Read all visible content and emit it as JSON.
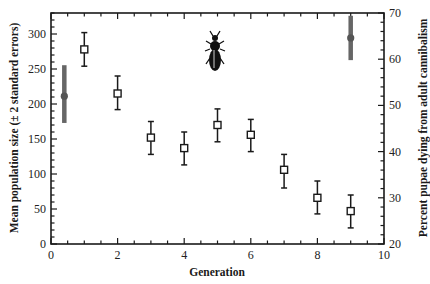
{
  "chart_data": {
    "type": "scatter",
    "title": "",
    "xlabel": "Generation",
    "ylabel": "Mean population size (± 2 standard errors)",
    "ylabel_right": "Percent pupae dying from adult cannibalism",
    "xlim": [
      0,
      10
    ],
    "ylim": [
      0,
      330
    ],
    "ylim_right": [
      20,
      70
    ],
    "x_ticks": [
      0,
      2,
      4,
      6,
      8,
      10
    ],
    "y_ticks": [
      0,
      50,
      100,
      150,
      200,
      250,
      300
    ],
    "y_ticks_right": [
      20,
      30,
      40,
      50,
      60,
      70
    ],
    "grid": false,
    "legend": null,
    "annotation": "beetle silhouette icon near top center (generation 5)",
    "series": [
      {
        "name": "Mean population size",
        "axis": "left",
        "marker": "open-square",
        "color": "#1a1a1a",
        "x": [
          1,
          2,
          3,
          4,
          5,
          6,
          7,
          8,
          9
        ],
        "values": [
          278,
          215,
          152,
          137,
          170,
          156,
          106,
          66,
          47
        ],
        "err_upper": [
          302,
          240,
          175,
          160,
          193,
          178,
          128,
          90,
          70
        ],
        "err_lower": [
          254,
          192,
          128,
          113,
          146,
          132,
          80,
          43,
          23
        ]
      },
      {
        "name": "Percent pupae dying from adult cannibalism",
        "axis": "right",
        "marker": "filled-circle",
        "color": "#666666",
        "x": [
          0.4,
          9
        ],
        "values": [
          52,
          64.6
        ],
        "err_upper": [
          58.7,
          69.4
        ],
        "err_lower": [
          46.2,
          59.8
        ]
      }
    ]
  },
  "labels": {
    "xlabel": "Generation",
    "ylabel": "Mean population size (± 2 standard errors)",
    "ylabel_right": "Percent pupae dying from adult cannibalism"
  },
  "icon": "beetle-icon"
}
